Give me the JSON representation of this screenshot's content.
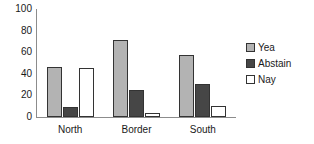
{
  "chart_data": {
    "type": "bar",
    "title": "",
    "subtitle": "",
    "xlabel": "",
    "ylabel": "",
    "categories": [
      "North",
      "Border",
      "South"
    ],
    "series": [
      {
        "name": "Yea",
        "color": "#b3b3b3",
        "values": [
          46,
          71,
          57
        ]
      },
      {
        "name": "Abstain",
        "color": "#464646",
        "values": [
          9,
          25,
          31
        ]
      },
      {
        "name": "Nay",
        "color": "#ffffff",
        "values": [
          45,
          4,
          10
        ]
      }
    ],
    "ylim": [
      0,
      100
    ],
    "ytick_labels": [
      "100",
      "80",
      "60",
      "40",
      "20",
      "0"
    ],
    "ytick_values": [
      100,
      80,
      60,
      40,
      20,
      0
    ],
    "grid": false,
    "legend_position": "right",
    "bar_border_color": "#333333",
    "axis_color": "#8c8c8c",
    "text_color": "#1a1a1a",
    "background": "#ffffff"
  },
  "legend": {
    "items": [
      {
        "label": "Yea"
      },
      {
        "label": "Abstain"
      },
      {
        "label": "Nay"
      }
    ]
  },
  "axis": {
    "y_labels": [
      "100",
      "80",
      "60",
      "40",
      "20",
      "0"
    ],
    "x_labels": [
      "North",
      "Border",
      "South"
    ]
  }
}
